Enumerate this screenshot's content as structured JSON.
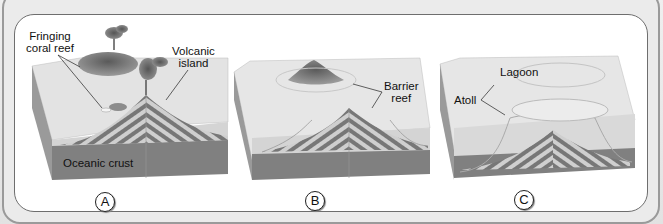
{
  "diagram": {
    "colors": {
      "background": "#e6e6e6",
      "panel": "#ffffff",
      "water_surface": "#e4e4e4",
      "water_side": "#d0d0d0",
      "crust": "#7e7e7e",
      "stripe_dark": "#777777",
      "stripe_light": "#cfcfcf"
    },
    "panels": [
      {
        "id": "A",
        "badge": "A",
        "labels": {
          "fringing_reef": "Fringing\ncoral reef",
          "fringing_reef_line1": "Fringing",
          "fringing_reef_line2": "coral reef",
          "volcanic_island_line1": "Volcanic",
          "volcanic_island_line2": "island",
          "oceanic_crust": "Oceanic crust"
        }
      },
      {
        "id": "B",
        "badge": "B",
        "labels": {
          "barrier_reef_line1": "Barrier",
          "barrier_reef_line2": "reef"
        }
      },
      {
        "id": "C",
        "badge": "C",
        "labels": {
          "lagoon": "Lagoon",
          "atoll": "Atoll"
        }
      }
    ]
  }
}
